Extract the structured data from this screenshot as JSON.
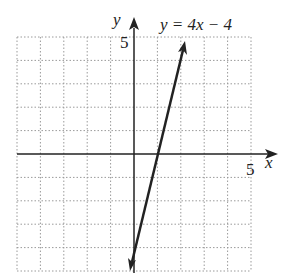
{
  "chart_data": {
    "type": "line",
    "title": "",
    "equation_label": "y = 4x − 4",
    "xlabel": "x",
    "ylabel": "y",
    "x_tick_label": "5",
    "y_tick_label": "5",
    "xlim": [
      -5,
      5
    ],
    "ylim": [
      -5,
      5
    ],
    "grid": true,
    "series": [
      {
        "name": "y = 4x − 4",
        "slope": 4,
        "intercept": -4,
        "x": [
          -0.1,
          2.25
        ],
        "y": [
          -4.4,
          5
        ]
      }
    ]
  }
}
